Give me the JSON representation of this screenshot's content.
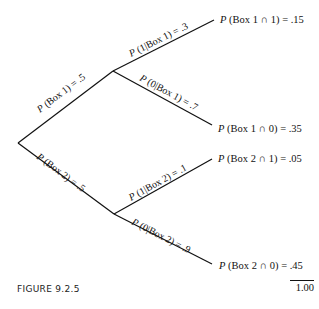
{
  "diagram": {
    "type": "probability-tree",
    "line_color": "#111111",
    "root": {
      "x": 18,
      "y": 143
    },
    "nodes": [
      {
        "id": "box1",
        "x": 113,
        "y": 71
      },
      {
        "id": "box2",
        "x": 114,
        "y": 214
      }
    ],
    "branches": [
      {
        "id": "box1",
        "label_prefix": "P",
        "label_rest": " (Box 1) = .5",
        "from": "root",
        "to": "box1"
      },
      {
        "id": "box2",
        "label_prefix": "P",
        "label_rest": " (Box 2) = .5",
        "from": "root",
        "to": "box2"
      },
      {
        "id": "one-given-box1",
        "label_prefix": "P",
        "label_rest": " (1|Box 1) = .3",
        "from": "box1"
      },
      {
        "id": "zero-given-box1",
        "label_prefix": "P",
        "label_rest": " (0|Box 1) = .7",
        "from": "box1"
      },
      {
        "id": "one-given-box2",
        "label_prefix": "P",
        "label_rest": " (1|Box 2) = .1",
        "from": "box2"
      },
      {
        "id": "zero-given-box2",
        "label_prefix": "P",
        "label_rest": " (0|Box 2) = .9",
        "from": "box2"
      }
    ],
    "leaves": [
      {
        "prefix": "P",
        "rest": " (Box 1 ∩ 1) = .15"
      },
      {
        "prefix": "P",
        "rest": " (Box 1 ∩ 0) = .35"
      },
      {
        "prefix": "P",
        "rest": " (Box 2 ∩ 1) = .05"
      },
      {
        "prefix": "P",
        "rest": " (Box 2 ∩ 0) = .45"
      }
    ],
    "total": "1.00"
  },
  "caption": "FIGURE  9.2.5"
}
